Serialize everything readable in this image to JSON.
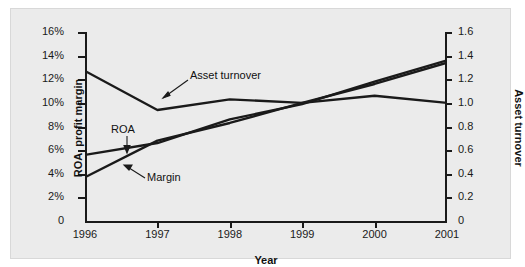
{
  "chart_data": {
    "type": "line",
    "title": "",
    "xlabel": "Year",
    "ylabel": "ROA, profit margin",
    "y2label": "Asset turnover",
    "grid": false,
    "legend": "none (inline annotations with leader lines)",
    "x": [
      "1996",
      "1997",
      "1998",
      "1999",
      "2000",
      "2001"
    ],
    "xlim": [
      "1996",
      "2001"
    ],
    "ylim": [
      0,
      16
    ],
    "ytick_labels": [
      "0",
      "2%",
      "4%",
      "6%",
      "8%",
      "10%",
      "12%",
      "14%",
      "16%"
    ],
    "ytick_values": [
      0,
      2,
      4,
      6,
      8,
      10,
      12,
      14,
      16
    ],
    "y2lim": [
      0,
      1.6
    ],
    "y2tick_labels": [
      "0",
      "0.2",
      "0.4",
      "0.6",
      "0.8",
      "1.0",
      "1.2",
      "1.4",
      "1.6"
    ],
    "y2tick_values": [
      0,
      0.2,
      0.4,
      0.6,
      0.8,
      1.0,
      1.2,
      1.4,
      1.6
    ],
    "series": [
      {
        "name": "Asset turnover",
        "axis": "right",
        "values": [
          1.27,
          0.94,
          1.03,
          1.0,
          1.06,
          1.0
        ],
        "values_left_scale": [
          12.7,
          9.4,
          10.3,
          10.0,
          10.6,
          10.0
        ],
        "color": "#1a1a1a",
        "annotation": "Asset turnover"
      },
      {
        "name": "ROA",
        "axis": "left",
        "values": [
          5.6,
          6.6,
          8.6,
          9.9,
          11.8,
          13.6
        ],
        "color": "#1a1a1a",
        "annotation": "ROA"
      },
      {
        "name": "Margin",
        "axis": "left",
        "values": [
          3.7,
          6.8,
          8.3,
          10.0,
          11.6,
          13.4
        ],
        "color": "#1a1a1a",
        "annotation": "Margin"
      }
    ]
  },
  "annotations": {
    "asset_turnover": "Asset turnover",
    "roa": "ROA",
    "margin": "Margin"
  },
  "axes": {
    "x_title": "Year",
    "y_left_title": "ROA, profit margin",
    "y_right_title": "Asset turnover"
  },
  "colors": {
    "figure_background": "#ebebeb",
    "page_background": "#ffffff",
    "axis": "#1a1a1a",
    "line": "#1a1a1a",
    "text": "#1a1a1a"
  }
}
